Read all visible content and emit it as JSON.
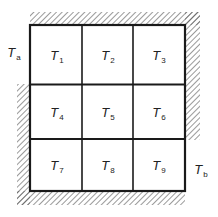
{
  "diagram": {
    "type": "grid-nodes",
    "grid": {
      "rows": 3,
      "cols": 3
    },
    "cells": [
      {
        "symbol": "T",
        "sub": "1"
      },
      {
        "symbol": "T",
        "sub": "2"
      },
      {
        "symbol": "T",
        "sub": "3"
      },
      {
        "symbol": "T",
        "sub": "4"
      },
      {
        "symbol": "T",
        "sub": "5"
      },
      {
        "symbol": "T",
        "sub": "6"
      },
      {
        "symbol": "T",
        "sub": "7"
      },
      {
        "symbol": "T",
        "sub": "8"
      },
      {
        "symbol": "T",
        "sub": "9"
      }
    ],
    "boundary_labels": {
      "left": {
        "symbol": "T",
        "sub": "a"
      },
      "right": {
        "symbol": "T",
        "sub": "b"
      }
    },
    "insulated_boundaries": [
      "top",
      "right-upper",
      "left-lower",
      "bottom"
    ],
    "colors": {
      "line": "#1a1a1a",
      "hatch": "#555555",
      "background": "#ffffff"
    }
  }
}
